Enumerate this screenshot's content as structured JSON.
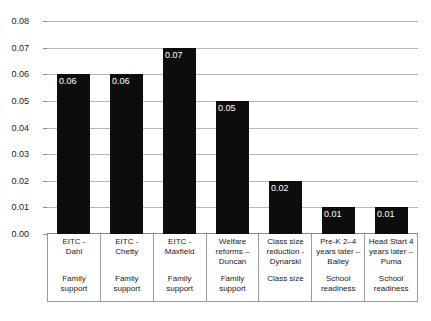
{
  "chart_data": {
    "type": "bar",
    "title": "",
    "xlabel": "",
    "ylabel": "",
    "ylim": [
      0,
      0.08
    ],
    "grid": true,
    "legend": "none",
    "orientation": "vertical",
    "bar_color": "#0d0d0d",
    "background": "#ffffff",
    "gridline_color": "#b8b8b8",
    "value_label_color": "#ffffff",
    "ytick_labels": [
      "0.08",
      "0.07",
      "0.06",
      "0.05",
      "0.04",
      "0.03",
      "0.02",
      "0.01",
      "0.00"
    ],
    "ytick_values": [
      0.08,
      0.07,
      0.06,
      0.05,
      0.04,
      0.03,
      0.02,
      0.01,
      0.0
    ],
    "categories": [
      "EITC - Dahl",
      "EITC - Chetty",
      "EITC - Maxfield",
      "Welfare reforms – Duncan",
      "Class size reduction - Dynarski",
      "Pre-K 2–4 years later – Bailey",
      "Head Start 4 years later – Puma"
    ],
    "values": [
      0.06,
      0.06,
      0.07,
      0.05,
      0.02,
      0.01,
      0.01
    ],
    "data_labels": [
      "0.06",
      "0.06",
      "0.07",
      "0.05",
      "0.02",
      "0.01",
      "0.01"
    ],
    "groups": [
      "Family support",
      "Family support",
      "Family support",
      "Family support",
      "Class size",
      "School readiness",
      "School readiness"
    ]
  },
  "category_table": {
    "columns": [
      {
        "study_lines": [
          "EITC -",
          "Dahl"
        ],
        "group_lines": [
          "Family",
          "support"
        ]
      },
      {
        "study_lines": [
          "EITC -",
          "Chetty"
        ],
        "group_lines": [
          "Family",
          "support"
        ]
      },
      {
        "study_lines": [
          "EITC -",
          "Maxfield"
        ],
        "group_lines": [
          "Family",
          "support"
        ]
      },
      {
        "study_lines": [
          "Welfare",
          "reforms –",
          "Duncan"
        ],
        "group_lines": [
          "Family",
          "support"
        ]
      },
      {
        "study_lines": [
          "Class size",
          "reduction -",
          "Dynarski"
        ],
        "group_lines": [
          "Class size"
        ]
      },
      {
        "study_lines": [
          "Pre-K 2–4",
          "years later –",
          "Bailey"
        ],
        "group_lines": [
          "School",
          "readiness"
        ]
      },
      {
        "study_lines": [
          "Head Start 4",
          "years later –",
          "Puma"
        ],
        "group_lines": [
          "School",
          "readiness"
        ]
      }
    ]
  }
}
